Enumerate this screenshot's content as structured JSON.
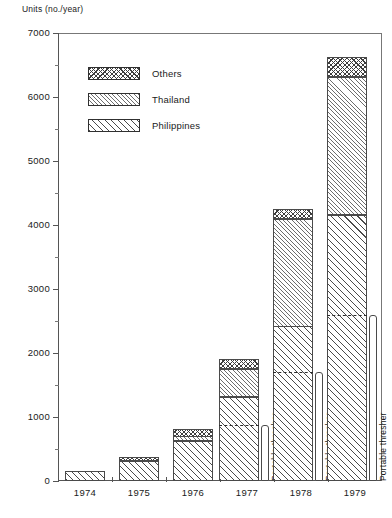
{
  "axis_title": "Units (no./year)",
  "legend": {
    "items": [
      {
        "label": "Others",
        "pattern": "cross-hatch"
      },
      {
        "label": "Thailand",
        "pattern": "fine-diagonal-hatch"
      },
      {
        "label": "Philippines",
        "pattern": "bold-diagonal-hatch"
      }
    ]
  },
  "annotations": {
    "portable_thresher": "Portable thresher"
  },
  "chart_data": {
    "type": "bar",
    "subtype": "stacked-bar",
    "title": "",
    "xlabel": "",
    "ylabel": "Units (no./year)",
    "ylim": [
      0,
      7000
    ],
    "ytick_major": [
      0,
      1000,
      2000,
      3000,
      4000,
      5000,
      6000,
      7000
    ],
    "ytick_minor": [
      500,
      1500,
      2500,
      3500,
      4500,
      5500,
      6500
    ],
    "ytick_labels": [
      "0",
      "1000",
      "2000",
      "3000",
      "4000",
      "5000",
      "6000",
      "7000"
    ],
    "grid": false,
    "legend_position": "upper-left-inside",
    "categories": [
      "1974",
      "1975",
      "1976",
      "1977",
      "1978",
      "1979"
    ],
    "series": [
      {
        "name": "Philippines",
        "values": [
          150,
          310,
          620,
          1320,
          2420,
          4150
        ]
      },
      {
        "name": "Thailand",
        "values": [
          0,
          0,
          80,
          430,
          1680,
          2160
        ]
      },
      {
        "name": "Others",
        "values": [
          0,
          70,
          120,
          150,
          150,
          310
        ]
      }
    ],
    "totals": [
      150,
      380,
      820,
      1900,
      4250,
      6620
    ],
    "portable_thresher": {
      "label": "Portable thresher",
      "values": [
        null,
        null,
        null,
        870,
        1700,
        2600
      ],
      "note": "dashed line within bars for 1977-1979 marking portable thresher share"
    }
  }
}
